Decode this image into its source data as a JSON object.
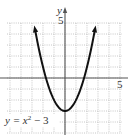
{
  "chart_data": {
    "type": "line",
    "title": "",
    "xlabel": "",
    "ylabel": "y",
    "xlim": [
      -5,
      5
    ],
    "ylim": [
      -5,
      5
    ],
    "grid": true,
    "x_tick_labels": [
      "5"
    ],
    "y_tick_labels": [
      "5"
    ],
    "series": [
      {
        "name": "y = x^2 - 3",
        "equation": "y = x^2 - 3",
        "x": [
          -2.83,
          -2,
          -1,
          0,
          1,
          2,
          2.83
        ],
        "y": [
          5,
          1,
          -2,
          -3,
          -2,
          1,
          5
        ]
      }
    ],
    "annotations": [
      {
        "text_main": "y = x",
        "superscript": "2",
        "text_tail": " − 3",
        "placement": "bottom-left"
      }
    ]
  }
}
